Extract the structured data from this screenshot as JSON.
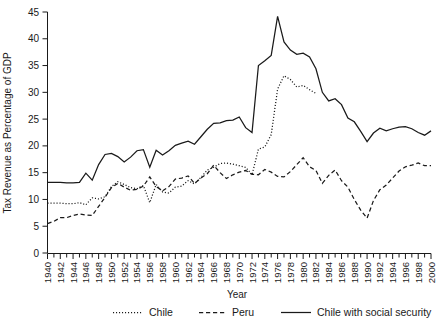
{
  "chart_data": {
    "type": "line",
    "title": "",
    "xlabel": "Year",
    "ylabel": "Tax Revenue as Percentage of GDP",
    "xlim": [
      1940,
      2000
    ],
    "ylim": [
      0,
      45
    ],
    "ytick_step": 5,
    "xtick_step": 2,
    "grid": false,
    "legend_position": "bottom",
    "yticks": [
      "0",
      "5",
      "10",
      "15",
      "20",
      "25",
      "30",
      "35",
      "40",
      "45"
    ],
    "xticks": [
      "1940",
      "1942",
      "1944",
      "1946",
      "1948",
      "1950",
      "1952",
      "1954",
      "1956",
      "1958",
      "1960",
      "1962",
      "1964",
      "1966",
      "1968",
      "1970",
      "1972",
      "1974",
      "1976",
      "1978",
      "1980",
      "1982",
      "1984",
      "1986",
      "1988",
      "1990",
      "1992",
      "1994",
      "1996",
      "1998",
      "2000"
    ],
    "x": [
      1940,
      1941,
      1942,
      1943,
      1944,
      1945,
      1946,
      1947,
      1948,
      1949,
      1950,
      1951,
      1952,
      1953,
      1954,
      1955,
      1956,
      1957,
      1958,
      1959,
      1960,
      1961,
      1962,
      1963,
      1964,
      1965,
      1966,
      1967,
      1968,
      1969,
      1970,
      1971,
      1972,
      1973,
      1974,
      1975,
      1976,
      1977,
      1978,
      1979,
      1980,
      1981,
      1982,
      1983,
      1984,
      1985,
      1986,
      1987,
      1988,
      1989,
      1990,
      1991,
      1992,
      1993,
      1994,
      1995,
      1996,
      1997,
      1998,
      1999,
      2000
    ],
    "series": [
      {
        "name": "Chile",
        "style": "dotted",
        "color": "#1a1a1a",
        "x_start": 1940,
        "x_end": 1982,
        "values": [
          9.3,
          9.3,
          9.3,
          9.2,
          9.2,
          9.4,
          9.0,
          10.3,
          10.1,
          10.5,
          12.4,
          13.3,
          12.8,
          12.2,
          12.0,
          12.6,
          9.4,
          12.8,
          11.4,
          11.2,
          12.3,
          12.5,
          13.5,
          12.9,
          14.1,
          15.5,
          16.0,
          16.7,
          16.8,
          16.6,
          16.3,
          16.0,
          14.6,
          19.4,
          19.8,
          22.1,
          30.6,
          33.1,
          32.4,
          31.0,
          31.3,
          30.5,
          29.8,
          null,
          null,
          null,
          null,
          null,
          null,
          null,
          null,
          null,
          null,
          null,
          null,
          null,
          null,
          null,
          null,
          null,
          null
        ]
      },
      {
        "name": "Peru",
        "style": "dashed",
        "color": "#1a1a1a",
        "x_start": 1940,
        "x_end": 2000,
        "values": [
          5.5,
          5.9,
          6.6,
          6.6,
          7.0,
          7.3,
          7.1,
          7.0,
          8.7,
          10.4,
          12.2,
          13.0,
          12.3,
          11.7,
          11.9,
          12.5,
          14.2,
          12.4,
          11.6,
          12.4,
          13.8,
          14.0,
          14.4,
          13.0,
          14.0,
          14.8,
          16.4,
          15.0,
          13.9,
          14.6,
          15.1,
          15.4,
          14.7,
          14.6,
          15.6,
          15.1,
          14.3,
          14.2,
          15.2,
          16.5,
          17.8,
          16.1,
          15.4,
          13.0,
          14.5,
          15.5,
          13.5,
          12.3,
          10.0,
          8.0,
          6.5,
          9.8,
          11.8,
          12.7,
          14.0,
          15.3,
          16.1,
          16.4,
          16.8,
          16.3,
          16.3
        ]
      },
      {
        "name": "Chile with social security",
        "style": "solid",
        "color": "#1a1a1a",
        "x_start": 1940,
        "x_end": 2000,
        "values": [
          13.2,
          13.2,
          13.2,
          13.1,
          13.1,
          13.2,
          14.9,
          13.6,
          16.5,
          18.4,
          18.6,
          18.0,
          17.0,
          17.9,
          19.1,
          19.3,
          16.0,
          19.2,
          18.3,
          19.1,
          20.1,
          20.5,
          20.9,
          20.3,
          21.7,
          23.1,
          24.2,
          24.3,
          24.7,
          24.8,
          25.4,
          23.4,
          22.5,
          35.0,
          35.9,
          36.9,
          44.2,
          39.4,
          37.9,
          37.1,
          37.3,
          36.6,
          34.4,
          30.0,
          28.4,
          28.8,
          27.7,
          25.2,
          24.5,
          22.7,
          20.8,
          22.4,
          23.3,
          22.8,
          23.2,
          23.5,
          23.6,
          23.2,
          22.5,
          22.0,
          22.8
        ]
      }
    ]
  },
  "legend": {
    "items": [
      {
        "label": "Chile",
        "style": "dotted"
      },
      {
        "label": "Peru",
        "style": "dashed"
      },
      {
        "label": "Chile with social security",
        "style": "solid"
      }
    ]
  }
}
